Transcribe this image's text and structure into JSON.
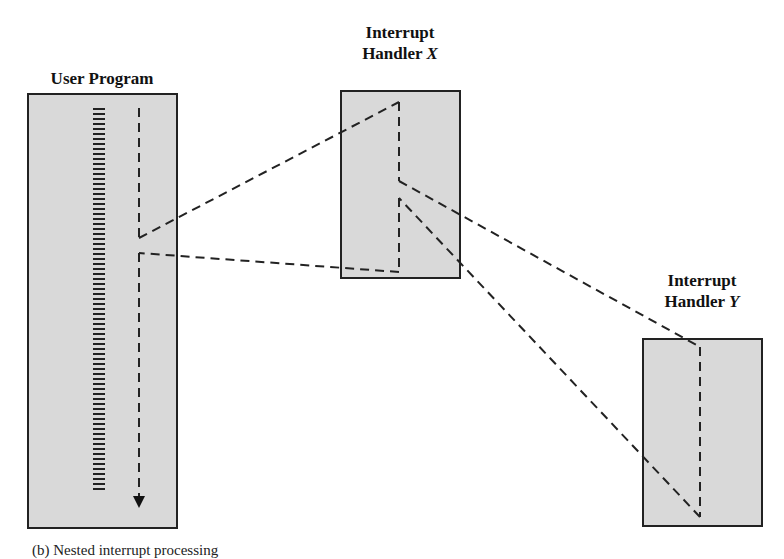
{
  "diagram": {
    "user_program": {
      "title": "User Program"
    },
    "handler_x": {
      "title_line1": "Interrupt",
      "title_line2": "Handler ",
      "title_var": "X"
    },
    "handler_y": {
      "title_line1": "Interrupt",
      "title_line2": "Handler ",
      "title_var": "Y"
    },
    "caption": "(b) Nested interrupt processing",
    "colors": {
      "box_fill": "#d9d9d9",
      "border": "#222222",
      "line": "#222222"
    }
  }
}
